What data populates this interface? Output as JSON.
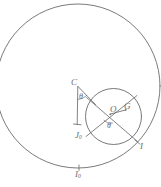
{
  "figure": {
    "type": "geometry-diagram",
    "background_color": "#ffffff",
    "stroke_color": "#6b6b6b",
    "label_color": "#6b6b6b",
    "labels": {
      "apex": "C",
      "center_inner": "O",
      "point_g": "G",
      "point_i": "I",
      "point_j0_base": "J",
      "point_j0_sub": "0",
      "point_i0_base": "I",
      "point_i0_sub": "0",
      "angle_at_c": "θ",
      "angle_at_o": "θ"
    },
    "shapes": {
      "outer_circle": {
        "cx": 78,
        "cy": 86,
        "r": 82
      },
      "inner_circle": {
        "cx": 113.5,
        "cy": 116.5,
        "r": 28
      },
      "chord_1": {
        "x1": 88,
        "y1": 98,
        "x2": 138,
        "y2": 141
      },
      "chord_2": {
        "x1": 86,
        "y1": 136,
        "x2": 136,
        "y2": 96
      },
      "radius_og": {
        "x1": 110,
        "y1": 114,
        "x2": 125,
        "y2": 110
      },
      "vertical_at_c": {
        "x1": 78,
        "y1": 86,
        "x2": 78,
        "y2": 125
      },
      "ray_c_to_circle": {
        "x1": 78,
        "y1": 86,
        "x2": 95,
        "y2": 104
      },
      "tangent_point": {
        "x": 137,
        "y": 142
      },
      "bottom_tick": {
        "x": 79,
        "y": 168
      }
    }
  }
}
